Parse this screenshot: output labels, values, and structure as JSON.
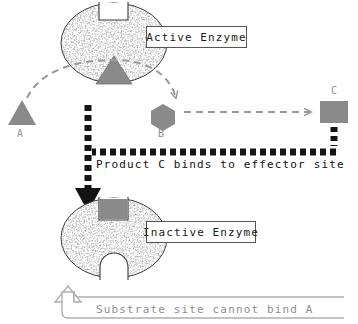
{
  "diagram": {
    "labels": {
      "active_enzyme": "Active Enzyme",
      "inactive_enzyme": "Inactive Enzyme",
      "product_c_binds": "Product C binds to effector site",
      "substrate_cannot_bind": "Substrate site cannot bind A"
    },
    "molecules": [
      {
        "id": "a",
        "label": "A",
        "shape": "triangle",
        "color": "#8a8a8a"
      },
      {
        "id": "b",
        "label": "B",
        "shape": "hexagon",
        "color": "#8a8a8a"
      },
      {
        "id": "c",
        "label": "C",
        "shape": "square",
        "color": "#8a8a8a"
      }
    ],
    "enzymes": [
      {
        "id": "active",
        "state": "Active Enzyme",
        "substrate_site": "notch-top-open",
        "effector_site": "triangle-bottom"
      },
      {
        "id": "inactive",
        "state": "Inactive Enzyme",
        "substrate_site": "rounded-bottom-closed",
        "effector_site": "square-top-occupied"
      }
    ],
    "arrows": [
      {
        "id": "a-to-b",
        "from": "A",
        "to": "B",
        "style": "dashed-curved",
        "color": "#9a9a9a"
      },
      {
        "id": "b-to-c",
        "from": "B",
        "to": "C",
        "style": "dashed-straight",
        "color": "#9a9a9a"
      },
      {
        "id": "c-feedback",
        "from": "C",
        "to": "Inactive Enzyme",
        "style": "dashed-thick",
        "color": "#141414"
      },
      {
        "id": "substrate-block",
        "from": "Inactive Enzyme",
        "to": "Substrate site",
        "style": "hollow-block",
        "color": "#b0b0b0"
      }
    ],
    "colors": {
      "molecule_gray": "#8a8a8a",
      "arrow_gray": "#9a9a9a",
      "feedback_black": "#141414",
      "hollow_arrow": "#b0b0b0",
      "caption_gray": "#8e8e8e",
      "outline": "#3a3a3a"
    }
  }
}
